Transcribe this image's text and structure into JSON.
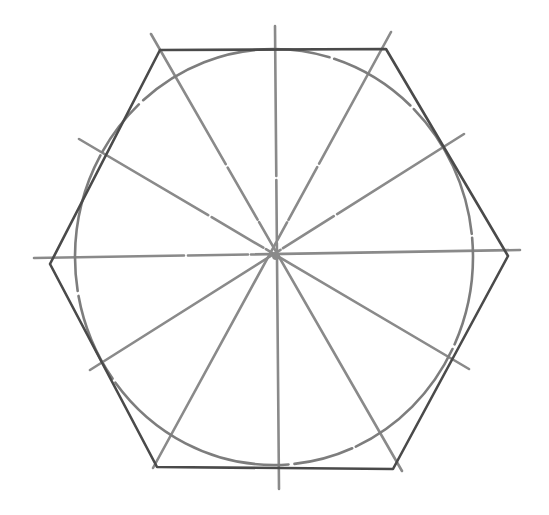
{
  "figure": {
    "colors": {
      "background": "#ffffff",
      "construction_line": "#8a8a8a",
      "circle": "#7d7d7d",
      "hexagon": "#4a4a4a"
    },
    "center": [
      276,
      256
    ],
    "circle": {
      "cx": 274,
      "cy": 257,
      "rx": 199,
      "ry": 208
    },
    "radial_lines": [
      {
        "name": "vertical",
        "x1": 275,
        "y1": 26,
        "x2": 279,
        "y2": 489
      },
      {
        "name": "horizontal",
        "x1": 34,
        "y1": 258,
        "x2": 520,
        "y2": 250
      },
      {
        "name": "diag-nw-se",
        "x1": 79,
        "y1": 139,
        "x2": 469,
        "y2": 369
      },
      {
        "name": "diag-ne-sw",
        "x1": 464,
        "y1": 134,
        "x2": 90,
        "y2": 370
      },
      {
        "name": "steep-nnw-sse",
        "x1": 151,
        "y1": 34,
        "x2": 402,
        "y2": 471
      },
      {
        "name": "steep-nne-ssw",
        "x1": 391,
        "y1": 32,
        "x2": 153,
        "y2": 468
      }
    ],
    "hexagon": {
      "points": [
        [
          160,
          50
        ],
        [
          386,
          49
        ],
        [
          508,
          256
        ],
        [
          393,
          469
        ],
        [
          157,
          467
        ],
        [
          50,
          264
        ]
      ]
    }
  }
}
